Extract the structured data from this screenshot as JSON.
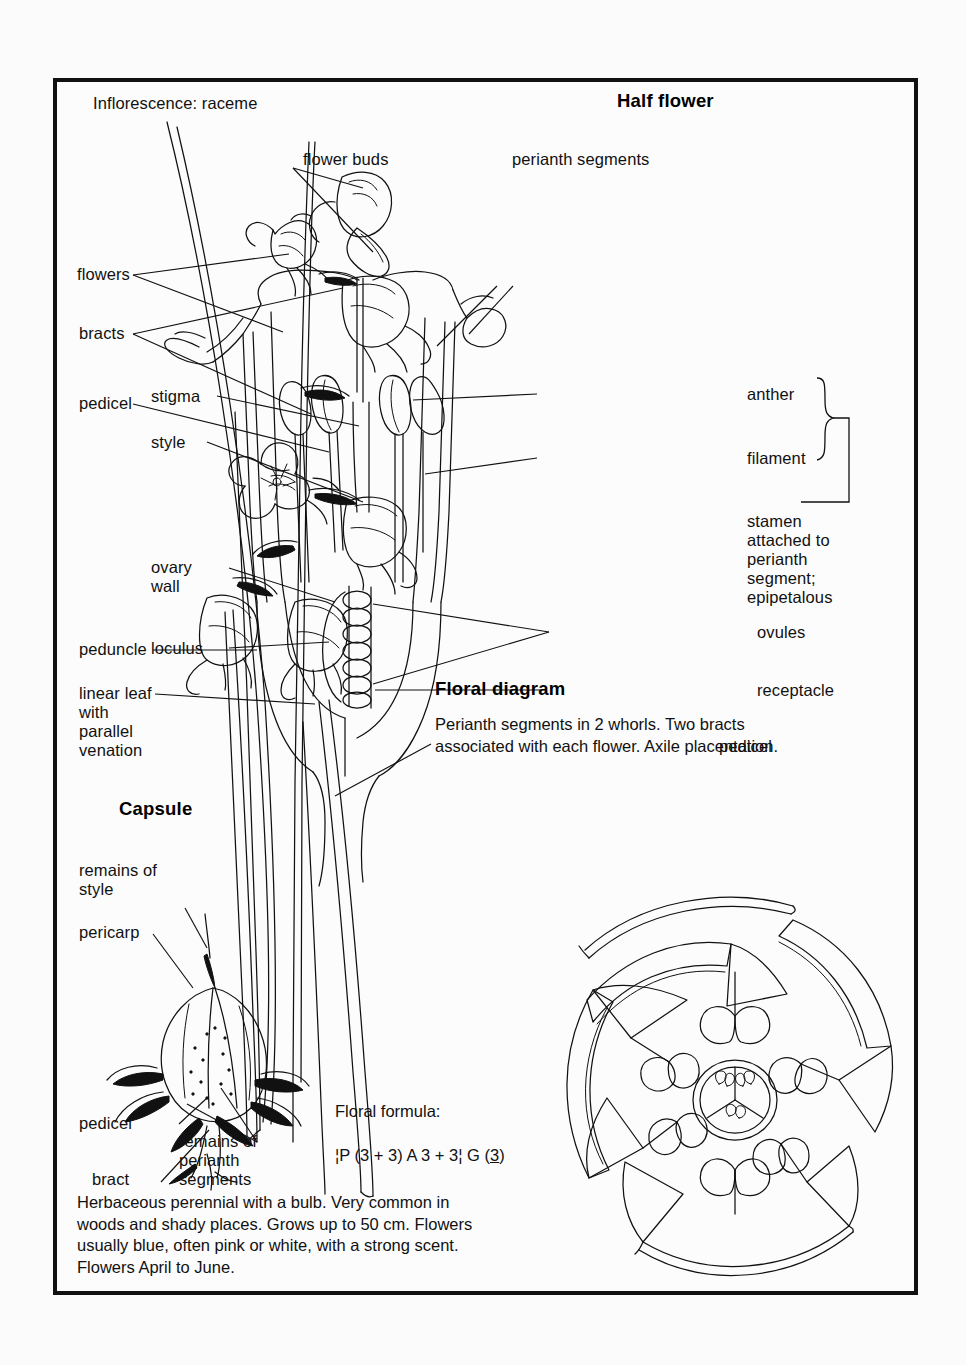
{
  "plate": {
    "title_inflorescence": "Inflorescence: raceme",
    "sections": {
      "half_flower": "Half flower",
      "floral_diagram": "Floral diagram",
      "capsule": "Capsule"
    },
    "inflorescence_labels": {
      "flower_buds": "flower buds",
      "flowers": "flowers",
      "bracts": "bracts",
      "pedicel": "pedicel",
      "peduncle": "peduncle",
      "linear_leaf": "linear leaf\nwith\nparallel\nvenation"
    },
    "half_flower_labels": {
      "perianth_segments": "perianth segments",
      "stigma": "stigma",
      "style": "style",
      "anther": "anther",
      "filament": "filament",
      "stamen_note": "stamen\nattached to\nperianth\nsegment;\nepipetalous",
      "ovary_wall": "ovary\nwall",
      "loculus": "loculus",
      "ovules": "ovules",
      "receptacle": "receptacle",
      "pedicel": "pedicel"
    },
    "capsule_labels": {
      "remains_of_style": "remains of\nstyle",
      "pericarp": "pericarp",
      "pedicel": "pedicel",
      "bract": "bract",
      "remains_of_perianth": "remains of\nperianth\nsegments"
    },
    "floral_diagram_text": "Perianth segments in 2 whorls. Two bracts\nassociated with each flower. Axile placentation.",
    "floral_formula_heading": "Floral formula:",
    "floral_formula_line": "¦P (3 + 3) A 3 + 3¦ G (3)",
    "floral_formula_parts": {
      "prefix": "¦P (3 + 3) A 3 + 3¦ G (",
      "underlined": "3",
      "suffix": ")"
    },
    "description": "Herbaceous perennial with a bulb. Very common in\nwoods and shady places. Grows up to 50 cm. Flowers\nusually blue, often pink or white, with a strong scent.\nFlowers April to June."
  },
  "colors": {
    "ink": "#111111",
    "paper": "#fcfcfc",
    "page": "#fbfbfb"
  }
}
